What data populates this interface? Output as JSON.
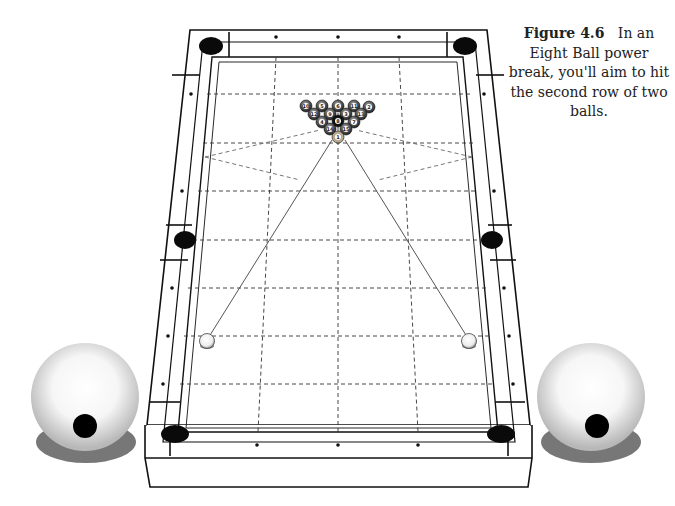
{
  "figure": {
    "label": "Figure 4.6",
    "caption": "In an Eight Ball power break, you'll aim to hit the second row of two balls."
  },
  "diagram": {
    "rack": {
      "rows": [
        [
          "10",
          "5",
          "6",
          "11",
          "2"
        ],
        [
          "12",
          "9",
          "3",
          "13"
        ],
        [
          "4",
          "8",
          "7"
        ],
        [
          "14",
          "15"
        ],
        [
          "1"
        ]
      ]
    },
    "cue_ball_positions": [
      "left-of-head-string",
      "right-of-head-string"
    ],
    "aim_lines": 2,
    "enlarged_cue_balls": [
      "left",
      "right"
    ],
    "colors": {
      "line": "#111111",
      "pocket": "#0a0a0a",
      "ball_shadow": "#777777",
      "dash": "#333333"
    }
  }
}
